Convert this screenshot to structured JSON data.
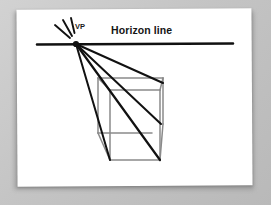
{
  "figure": {
    "kind": "one-point-perspective-diagram",
    "medium": "printed page photograph",
    "background_color": "#c6c6c6",
    "page_color": "#ffffff",
    "page_rotation_deg": -0.35
  },
  "labels": {
    "horizon_line": "Horizon line",
    "vanishing_point": "VP"
  },
  "colors": {
    "ink_black": "#111111",
    "construction_gray": "#8a8a8a",
    "page_white": "#ffffff",
    "background_gray": "#c6c6c6",
    "shadow_gray": "#8e8e8e"
  },
  "geometry": {
    "horizon": {
      "x1": 37,
      "y1": 44.5,
      "x2": 233,
      "y2": 43.5,
      "stroke_width": 2.6
    },
    "vanishing_point": {
      "x": 76,
      "y": 44,
      "radius": 3.1
    },
    "starburst": [
      {
        "x1": 55,
        "y1": 25,
        "x2": 70,
        "y2": 38
      },
      {
        "x1": 63,
        "y1": 20,
        "x2": 72,
        "y2": 36
      },
      {
        "x1": 71,
        "y1": 18,
        "x2": 74.5,
        "y2": 33
      }
    ],
    "projection_lines": [
      {
        "x1": 76,
        "y1": 44,
        "x2": 110,
        "y2": 160,
        "stroke_width": 2.0
      },
      {
        "x1": 76,
        "y1": 44,
        "x2": 160,
        "y2": 160,
        "stroke_width": 2.2
      },
      {
        "x1": 76,
        "y1": 44,
        "x2": 161,
        "y2": 124,
        "stroke_width": 2.0
      },
      {
        "x1": 76,
        "y1": 44,
        "x2": 163,
        "y2": 83,
        "stroke_width": 2.0
      }
    ],
    "cube_front_face": {
      "x": 110,
      "y": 90,
      "width": 50,
      "height": 70
    },
    "cube_edges_gray": [
      {
        "name": "front-top",
        "x1": 110,
        "y1": 90,
        "x2": 160,
        "y2": 90
      },
      {
        "name": "front-left",
        "x1": 110,
        "y1": 90,
        "x2": 110,
        "y2": 160
      },
      {
        "name": "front-right",
        "x1": 160,
        "y1": 90,
        "x2": 160,
        "y2": 160
      },
      {
        "name": "front-bottom",
        "x1": 110,
        "y1": 160,
        "x2": 160,
        "y2": 160
      },
      {
        "name": "back-top",
        "x1": 98,
        "y1": 78,
        "x2": 163,
        "y2": 78
      },
      {
        "name": "back-left",
        "x1": 98,
        "y1": 78,
        "x2": 98,
        "y2": 133
      },
      {
        "name": "back-right",
        "x1": 163,
        "y1": 78,
        "x2": 163,
        "y2": 124
      },
      {
        "name": "back-bottom",
        "x1": 98,
        "y1": 133,
        "x2": 152,
        "y2": 133
      },
      {
        "name": "edge-top-left",
        "x1": 98,
        "y1": 78,
        "x2": 110,
        "y2": 90
      },
      {
        "name": "edge-top-right",
        "x1": 163,
        "y1": 78,
        "x2": 160,
        "y2": 90
      },
      {
        "name": "edge-bottom-left",
        "x1": 98,
        "y1": 133,
        "x2": 110,
        "y2": 160
      },
      {
        "name": "edge-bottom-right",
        "x1": 163,
        "y1": 124,
        "x2": 160,
        "y2": 160
      }
    ],
    "cube_stroke_width": 1.5
  },
  "chart_data": {
    "type": "diagram",
    "elements": [
      {
        "label": "Horizon line",
        "role": "reference-line",
        "orientation": "horizontal"
      },
      {
        "label": "VP",
        "role": "vanishing-point",
        "x": 76,
        "y": 44
      },
      {
        "label": "Cube",
        "role": "receding-box",
        "faces": 3
      },
      {
        "label": "Projection lines",
        "role": "convergence-rays",
        "count": 4
      }
    ]
  }
}
